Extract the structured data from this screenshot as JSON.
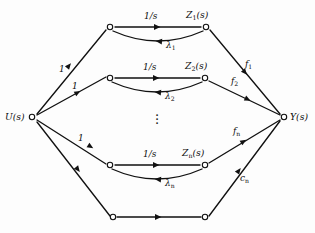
{
  "figure": {
    "type": "signal-flow-graph",
    "background_color": "#fdfdfd",
    "line_color": "#111111",
    "node_fill": "#ffffff",
    "nodes": [
      {
        "id": "U",
        "label": "U(s)",
        "x": 32,
        "y": 117
      },
      {
        "id": "Y",
        "label": "Y(s)",
        "x": 284,
        "y": 117
      },
      {
        "id": "A1",
        "label": "",
        "x": 110,
        "y": 27
      },
      {
        "id": "Z1",
        "label": "Z1(s)",
        "x": 206,
        "y": 27
      },
      {
        "id": "A2",
        "label": "",
        "x": 110,
        "y": 78
      },
      {
        "id": "Z2",
        "label": "Z2(s)",
        "x": 205,
        "y": 78
      },
      {
        "id": "An",
        "label": "",
        "x": 110,
        "y": 165
      },
      {
        "id": "Zn",
        "label": "Zn(s)",
        "x": 205,
        "y": 165
      },
      {
        "id": "B1",
        "label": "",
        "x": 113,
        "y": 217
      },
      {
        "id": "B2",
        "label": "",
        "x": 205,
        "y": 217
      }
    ],
    "node_labels": {
      "u": {
        "base": "U",
        "arg": "(s)"
      },
      "y": {
        "base": "Y",
        "arg": "(s)"
      },
      "z1": {
        "base": "Z",
        "sub": "1",
        "arg": "(s)"
      },
      "z2": {
        "base": "Z",
        "sub": "2",
        "arg": "(s)"
      },
      "zn": {
        "base": "Z",
        "sub": "n",
        "arg": "(s)"
      }
    },
    "edge_labels": {
      "integrator": "1/s",
      "unity_gain": "1",
      "lambda1": {
        "base": "λ",
        "sub": "1"
      },
      "lambda2": {
        "base": "λ",
        "sub": "2"
      },
      "lambdan": {
        "base": "λ",
        "sub": "n"
      },
      "f1": {
        "base": "f",
        "sub": "1"
      },
      "f2": {
        "base": "f",
        "sub": "2"
      },
      "fn": {
        "base": "f",
        "sub": "n"
      },
      "cn": {
        "base": "c",
        "sub": "n"
      }
    },
    "ellipsis": {
      "x": 157,
      "y": 116,
      "glyph": "·"
    },
    "branches": [
      {
        "index": 1,
        "input_gain": "1",
        "forward_gain": "1/s",
        "feedback_gain": "λ1",
        "output_gain": "f1",
        "state": "Z1(s)"
      },
      {
        "index": 2,
        "input_gain": "1",
        "forward_gain": "1/s",
        "feedback_gain": "λ2",
        "output_gain": "f2",
        "state": "Z2(s)"
      },
      {
        "index": "n",
        "input_gain": "1",
        "forward_gain": "1/s",
        "feedback_gain": "λn",
        "output_gain": "fn",
        "state": "Zn(s)"
      },
      {
        "index": "direct",
        "input_gain": "",
        "forward_gain": "",
        "feedback_gain": "",
        "output_gain": "cn",
        "state": ""
      }
    ]
  }
}
